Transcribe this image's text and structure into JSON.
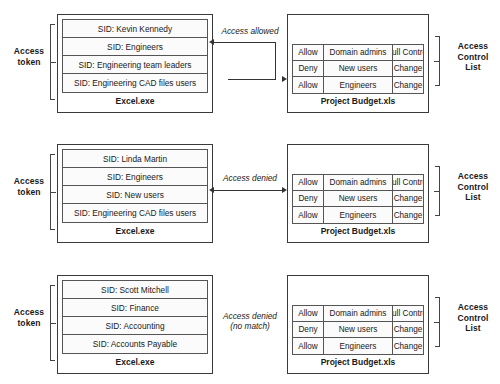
{
  "diagram": {
    "left_bracket_label": "Access\ntoken",
    "right_bracket_label": "Access\nControl\nList",
    "left_bracket_label_lines": [
      "Access",
      "token"
    ],
    "right_bracket_label_lines": [
      "Access",
      "Control",
      "List"
    ],
    "ace_columns": [
      "Type",
      "Trustee",
      "Permission"
    ],
    "rows": [
      {
        "token": {
          "process_name": "Excel.exe",
          "sids": [
            "SID: Kevin Kennedy",
            "SID: Engineers",
            "SID: Engineering team leaders",
            "SID: Engineering CAD files users"
          ]
        },
        "acl": {
          "file_name": "Project Budget.xls",
          "aces": [
            {
              "type": "Allow",
              "trustee": "Domain admins",
              "permission": "Full Control"
            },
            {
              "type": "Deny",
              "trustee": "New users",
              "permission": "Change"
            },
            {
              "type": "Allow",
              "trustee": "Engineers",
              "permission": "Change"
            }
          ]
        },
        "connector": {
          "label": "Access allowed",
          "style": "stepped",
          "from_sid_index": 1,
          "to_ace_index": 2
        }
      },
      {
        "token": {
          "process_name": "Excel.exe",
          "sids": [
            "SID: Linda Martin",
            "SID: Engineers",
            "SID: New users",
            "SID: Engineering CAD files users"
          ]
        },
        "acl": {
          "file_name": "Project Budget.xls",
          "aces": [
            {
              "type": "Allow",
              "trustee": "Domain admins",
              "permission": "Full Control"
            },
            {
              "type": "Deny",
              "trustee": "New users",
              "permission": "Change"
            },
            {
              "type": "Allow",
              "trustee": "Engineers",
              "permission": "Change"
            }
          ]
        },
        "connector": {
          "label": "Access denied",
          "style": "straight",
          "from_sid_index": 2,
          "to_ace_index": 1
        }
      },
      {
        "token": {
          "process_name": "Excel.exe",
          "sids": [
            "SID: Scott Mitchell",
            "SID: Finance",
            "SID: Accounting",
            "SID: Accounts Payable"
          ]
        },
        "acl": {
          "file_name": "Project Budget.xls",
          "aces": [
            {
              "type": "Allow",
              "trustee": "Domain admins",
              "permission": "Full Control"
            },
            {
              "type": "Deny",
              "trustee": "New users",
              "permission": "Change"
            },
            {
              "type": "Allow",
              "trustee": "Engineers",
              "permission": "Change"
            }
          ]
        },
        "connector": {
          "label": "Access denied\n(no match)",
          "style": "none"
        }
      }
    ],
    "colors": {
      "line": "#444444",
      "box_border": "#3a3a3a",
      "table_border": "#555555",
      "arrow": "#333333",
      "background": "#ffffff",
      "text": "#1a1a1a"
    }
  }
}
